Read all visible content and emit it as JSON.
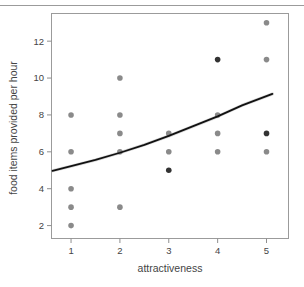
{
  "figure": {
    "name": "attractiveness-food-scatter",
    "background_color": "#ffffff",
    "top_rule_color": "#9b9b9b"
  },
  "chart_data": {
    "type": "scatter",
    "title": "",
    "subtitle": "",
    "xlabel": "attractiveness",
    "ylabel": "food items provided per hour",
    "xlim": [
      0.6,
      5.45
    ],
    "ylim": [
      1.3,
      13.5
    ],
    "xticks": [
      1,
      2,
      3,
      4,
      5
    ],
    "xtick_labels": [
      "1",
      "2",
      "3",
      "4",
      "5"
    ],
    "yticks": [
      2,
      4,
      6,
      8,
      10,
      12
    ],
    "ytick_labels": [
      "2",
      "4",
      "6",
      "8",
      "10",
      "12"
    ],
    "grid": false,
    "legend": null,
    "panel_border": true,
    "panel_border_color": "#9b9b9b",
    "series": [
      {
        "name": "observations-light",
        "marker": "circle",
        "color": "#8a8a8a",
        "marker_size": 5.6,
        "points": [
          {
            "x": 1,
            "y": 8
          },
          {
            "x": 1,
            "y": 6
          },
          {
            "x": 1,
            "y": 4
          },
          {
            "x": 1,
            "y": 3
          },
          {
            "x": 1,
            "y": 2
          },
          {
            "x": 2,
            "y": 10
          },
          {
            "x": 2,
            "y": 8
          },
          {
            "x": 2,
            "y": 7
          },
          {
            "x": 2,
            "y": 6
          },
          {
            "x": 2,
            "y": 3
          },
          {
            "x": 3,
            "y": 7
          },
          {
            "x": 3,
            "y": 6
          },
          {
            "x": 4,
            "y": 8
          },
          {
            "x": 4,
            "y": 7
          },
          {
            "x": 4,
            "y": 6
          },
          {
            "x": 5,
            "y": 13
          },
          {
            "x": 5,
            "y": 11
          },
          {
            "x": 5,
            "y": 6
          }
        ]
      },
      {
        "name": "observations-dark",
        "marker": "circle",
        "color": "#333333",
        "marker_size": 5.6,
        "points": [
          {
            "x": 3,
            "y": 5
          },
          {
            "x": 4,
            "y": 11
          },
          {
            "x": 5,
            "y": 7
          }
        ]
      }
    ],
    "fit_line": {
      "name": "fitted-curve",
      "color": "#111111",
      "width": 1.8,
      "points": [
        {
          "x": 0.62,
          "y": 4.97
        },
        {
          "x": 1.0,
          "y": 5.22
        },
        {
          "x": 1.5,
          "y": 5.56
        },
        {
          "x": 2.0,
          "y": 5.95
        },
        {
          "x": 2.5,
          "y": 6.38
        },
        {
          "x": 3.0,
          "y": 6.86
        },
        {
          "x": 3.5,
          "y": 7.39
        },
        {
          "x": 4.0,
          "y": 7.92
        },
        {
          "x": 4.5,
          "y": 8.52
        },
        {
          "x": 5.12,
          "y": 9.14
        }
      ]
    },
    "confidence_band": {
      "name": "confidence-band",
      "color": "#bfbfbf",
      "opacity": 0.6,
      "width": 3.2
    }
  }
}
